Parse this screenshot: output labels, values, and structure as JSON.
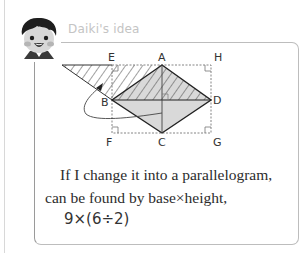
{
  "header": {
    "title": "Daiki's idea",
    "avatar": "boy-avatar-icon"
  },
  "diagram": {
    "labels": {
      "A": "A",
      "B": "B",
      "C": "C",
      "D": "D",
      "E": "E",
      "F": "F",
      "G": "G",
      "H": "H"
    },
    "colors": {
      "shade": "#d9d9d9",
      "hatch": "#444444",
      "outline": "#222222",
      "dashed": "#777777"
    }
  },
  "text": {
    "line1": "If I change it into a parallelogram,",
    "line2": "can be found by base×height,",
    "formula": "9×(6÷2)"
  }
}
